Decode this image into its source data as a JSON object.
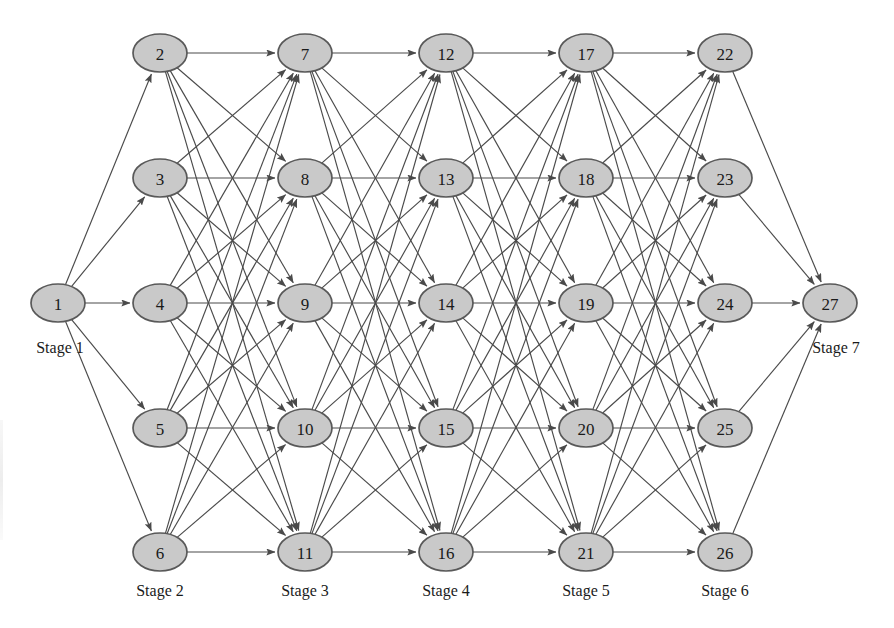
{
  "figure": {
    "type": "directed-layered-network",
    "title": "",
    "background_color": "#ffffff",
    "node_fill": "#c9c9c9",
    "node_stroke": "#595959",
    "edge_color": "#4a4a4a",
    "label_color": "#1a1a1a",
    "node_rx": 27,
    "node_ry": 19
  },
  "stages": [
    {
      "id": "stage-1",
      "label": "Stage 1",
      "x": 58,
      "label_x": 60,
      "label_y": 353,
      "nodes": [
        "1"
      ]
    },
    {
      "id": "stage-2",
      "label": "Stage 2",
      "x": 160,
      "label_x": 160,
      "label_y": 596,
      "nodes": [
        "2",
        "3",
        "4",
        "5",
        "6"
      ]
    },
    {
      "id": "stage-3",
      "label": "Stage 3",
      "x": 305,
      "label_x": 305,
      "label_y": 596,
      "nodes": [
        "7",
        "8",
        "9",
        "10",
        "11"
      ]
    },
    {
      "id": "stage-4",
      "label": "Stage 4",
      "x": 446,
      "label_x": 446,
      "label_y": 596,
      "nodes": [
        "12",
        "13",
        "14",
        "15",
        "16"
      ]
    },
    {
      "id": "stage-5",
      "label": "Stage 5",
      "x": 586,
      "label_x": 586,
      "label_y": 596,
      "nodes": [
        "17",
        "18",
        "19",
        "20",
        "21"
      ]
    },
    {
      "id": "stage-6",
      "label": "Stage 6",
      "x": 725,
      "label_x": 725,
      "label_y": 596,
      "nodes": [
        "22",
        "23",
        "24",
        "25",
        "26"
      ]
    },
    {
      "id": "stage-7",
      "label": "Stage 7",
      "x": 830,
      "label_x": 836,
      "label_y": 353,
      "nodes": [
        "27"
      ]
    }
  ],
  "row_y": [
    53,
    178,
    303,
    428,
    552
  ],
  "nodes": [
    {
      "id": "1",
      "label": "1",
      "x": 58,
      "y": 303,
      "stage": 1
    },
    {
      "id": "2",
      "label": "2",
      "x": 160,
      "y": 53,
      "stage": 2
    },
    {
      "id": "3",
      "label": "3",
      "x": 160,
      "y": 178,
      "stage": 2
    },
    {
      "id": "4",
      "label": "4",
      "x": 160,
      "y": 303,
      "stage": 2
    },
    {
      "id": "5",
      "label": "5",
      "x": 160,
      "y": 428,
      "stage": 2
    },
    {
      "id": "6",
      "label": "6",
      "x": 160,
      "y": 552,
      "stage": 2
    },
    {
      "id": "7",
      "label": "7",
      "x": 305,
      "y": 53,
      "stage": 3
    },
    {
      "id": "8",
      "label": "8",
      "x": 305,
      "y": 178,
      "stage": 3
    },
    {
      "id": "9",
      "label": "9",
      "x": 305,
      "y": 303,
      "stage": 3
    },
    {
      "id": "10",
      "label": "10",
      "x": 305,
      "y": 428,
      "stage": 3
    },
    {
      "id": "11",
      "label": "11",
      "x": 305,
      "y": 552,
      "stage": 3
    },
    {
      "id": "12",
      "label": "12",
      "x": 446,
      "y": 53,
      "stage": 4
    },
    {
      "id": "13",
      "label": "13",
      "x": 446,
      "y": 178,
      "stage": 4
    },
    {
      "id": "14",
      "label": "14",
      "x": 446,
      "y": 303,
      "stage": 4
    },
    {
      "id": "15",
      "label": "15",
      "x": 446,
      "y": 428,
      "stage": 4
    },
    {
      "id": "16",
      "label": "16",
      "x": 446,
      "y": 552,
      "stage": 4
    },
    {
      "id": "17",
      "label": "17",
      "x": 586,
      "y": 53,
      "stage": 5
    },
    {
      "id": "18",
      "label": "18",
      "x": 586,
      "y": 178,
      "stage": 5
    },
    {
      "id": "19",
      "label": "19",
      "x": 586,
      "y": 303,
      "stage": 5
    },
    {
      "id": "20",
      "label": "20",
      "x": 586,
      "y": 428,
      "stage": 5
    },
    {
      "id": "21",
      "label": "21",
      "x": 586,
      "y": 552,
      "stage": 5
    },
    {
      "id": "22",
      "label": "22",
      "x": 725,
      "y": 53,
      "stage": 6
    },
    {
      "id": "23",
      "label": "23",
      "x": 725,
      "y": 178,
      "stage": 6
    },
    {
      "id": "24",
      "label": "24",
      "x": 725,
      "y": 303,
      "stage": 6
    },
    {
      "id": "25",
      "label": "25",
      "x": 725,
      "y": 428,
      "stage": 6
    },
    {
      "id": "26",
      "label": "26",
      "x": 725,
      "y": 552,
      "stage": 6
    },
    {
      "id": "27",
      "label": "27",
      "x": 830,
      "y": 303,
      "stage": 7
    }
  ],
  "edge_layers": [
    {
      "from": [
        "1"
      ],
      "to": [
        "2",
        "3",
        "4",
        "5",
        "6"
      ],
      "complete_bipartite": true
    },
    {
      "from": [
        "2",
        "3",
        "4",
        "5",
        "6"
      ],
      "to": [
        "7",
        "8",
        "9",
        "10",
        "11"
      ],
      "complete_bipartite": true
    },
    {
      "from": [
        "7",
        "8",
        "9",
        "10",
        "11"
      ],
      "to": [
        "12",
        "13",
        "14",
        "15",
        "16"
      ],
      "complete_bipartite": true
    },
    {
      "from": [
        "12",
        "13",
        "14",
        "15",
        "16"
      ],
      "to": [
        "17",
        "18",
        "19",
        "20",
        "21"
      ],
      "complete_bipartite": true
    },
    {
      "from": [
        "17",
        "18",
        "19",
        "20",
        "21"
      ],
      "to": [
        "22",
        "23",
        "24",
        "25",
        "26"
      ],
      "complete_bipartite": true
    },
    {
      "from": [
        "22",
        "23",
        "24",
        "25",
        "26"
      ],
      "to": [
        "27"
      ],
      "complete_bipartite": true
    }
  ],
  "counts": {
    "nodes": 27,
    "stages": 7,
    "edges": 110
  }
}
